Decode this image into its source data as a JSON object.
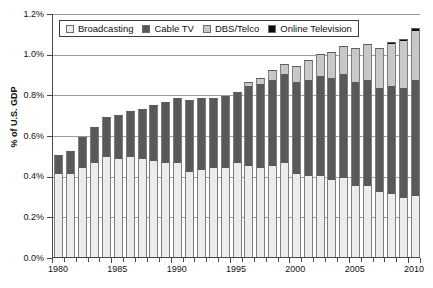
{
  "chart_data": {
    "type": "bar",
    "subtype": "stacked-bar",
    "title": "",
    "xlabel": "",
    "ylabel": "% of U.S. GDP",
    "ylim": [
      0.0,
      1.2
    ],
    "yticks": [
      "0.0%",
      "0.2%",
      "0.4%",
      "0.6%",
      "0.8%",
      "1.0%",
      "1.2%"
    ],
    "ytick_values": [
      0.0,
      0.2,
      0.4,
      0.6,
      0.8,
      1.0,
      1.2
    ],
    "xticks": [
      "1980",
      "1985",
      "1990",
      "1995",
      "2000",
      "2005",
      "2010"
    ],
    "grid": true,
    "legend_position": "top-left-inside",
    "categories": [
      "1980",
      "1981",
      "1982",
      "1983",
      "1984",
      "1985",
      "1986",
      "1987",
      "1988",
      "1989",
      "1990",
      "1991",
      "1992",
      "1993",
      "1994",
      "1995",
      "1996",
      "1997",
      "1998",
      "1999",
      "2000",
      "2001",
      "2002",
      "2003",
      "2004",
      "2005",
      "2006",
      "2007",
      "2008",
      "2009",
      "2010"
    ],
    "series": [
      {
        "name": "Broadcasting",
        "color": "#ececec",
        "values": [
          0.41,
          0.41,
          0.44,
          0.46,
          0.49,
          0.48,
          0.49,
          0.48,
          0.47,
          0.46,
          0.46,
          0.42,
          0.43,
          0.44,
          0.44,
          0.46,
          0.45,
          0.44,
          0.45,
          0.46,
          0.41,
          0.4,
          0.4,
          0.38,
          0.39,
          0.35,
          0.35,
          0.32,
          0.31,
          0.29,
          0.3
        ]
      },
      {
        "name": "Cable TV",
        "color": "#595959",
        "values": [
          0.09,
          0.11,
          0.15,
          0.18,
          0.2,
          0.22,
          0.23,
          0.25,
          0.28,
          0.3,
          0.32,
          0.35,
          0.35,
          0.34,
          0.35,
          0.35,
          0.39,
          0.41,
          0.42,
          0.44,
          0.45,
          0.47,
          0.49,
          0.5,
          0.51,
          0.51,
          0.52,
          0.51,
          0.53,
          0.54,
          0.57
        ]
      },
      {
        "name": "DBS/Telco",
        "color": "#c8c8c8",
        "values": [
          0.0,
          0.0,
          0.0,
          0.0,
          0.0,
          0.0,
          0.0,
          0.0,
          0.0,
          0.0,
          0.0,
          0.0,
          0.0,
          0.0,
          0.0,
          0.0,
          0.02,
          0.03,
          0.05,
          0.05,
          0.08,
          0.1,
          0.11,
          0.13,
          0.14,
          0.17,
          0.18,
          0.2,
          0.21,
          0.23,
          0.24
        ]
      },
      {
        "name": "Online Television",
        "color": "#0d0d0d",
        "values": [
          0.0,
          0.0,
          0.0,
          0.0,
          0.0,
          0.0,
          0.0,
          0.0,
          0.0,
          0.0,
          0.0,
          0.0,
          0.0,
          0.0,
          0.0,
          0.0,
          0.0,
          0.0,
          0.0,
          0.0,
          0.0,
          0.0,
          0.0,
          0.0,
          0.0,
          0.0,
          0.0,
          0.0,
          0.005,
          0.01,
          0.015
        ]
      }
    ],
    "totals": [
      0.5,
      0.52,
      0.59,
      0.64,
      0.69,
      0.7,
      0.72,
      0.73,
      0.75,
      0.76,
      0.78,
      0.77,
      0.78,
      0.78,
      0.79,
      0.81,
      0.86,
      0.88,
      0.92,
      0.95,
      0.94,
      0.97,
      1.0,
      1.01,
      1.04,
      1.03,
      1.05,
      1.03,
      1.045,
      1.065,
      1.125
    ]
  },
  "legend": {
    "items": [
      {
        "label": "Broadcasting"
      },
      {
        "label": "Cable TV"
      },
      {
        "label": "DBS/Telco"
      },
      {
        "label": "Online Television"
      }
    ]
  }
}
